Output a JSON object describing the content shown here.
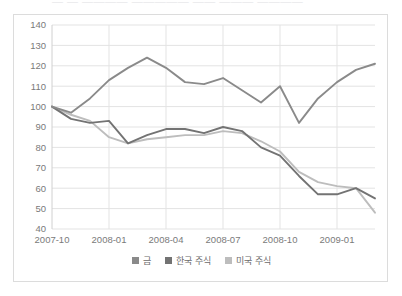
{
  "page": {
    "clipped_header_text": "— — ———— ————— —— ——— ————"
  },
  "legend": {
    "position": "bottom-center",
    "items": [
      {
        "label": "금",
        "color": "#8a8a8a"
      },
      {
        "label": "한국 주식",
        "color": "#737373"
      },
      {
        "label": "미국 주식",
        "color": "#bdbdbd"
      }
    ]
  },
  "chart_data": {
    "type": "line",
    "title": "",
    "subtitle": "",
    "xlabel": "",
    "ylabel": "",
    "ylim": [
      40,
      140
    ],
    "ytick_step": 10,
    "yticks": [
      "140",
      "130",
      "120",
      "110",
      "100",
      "90",
      "80",
      "70",
      "60",
      "50",
      "40"
    ],
    "grid": true,
    "grid_color": "#e3e3e3",
    "x": [
      "2007-10",
      "2007-11",
      "2007-12",
      "2008-01",
      "2008-02",
      "2008-03",
      "2008-04",
      "2008-05",
      "2008-06",
      "2008-07",
      "2008-08",
      "2008-09",
      "2008-10",
      "2008-11",
      "2008-12",
      "2009-01",
      "2009-02",
      "2009-03"
    ],
    "xtick_labels": [
      "2007-10",
      "2008-01",
      "2008-04",
      "2008-07",
      "2008-10",
      "2009-01"
    ],
    "series": [
      {
        "name": "금",
        "color": "#8a8a8a",
        "values": [
          100,
          97,
          104,
          113,
          119,
          124,
          119,
          112,
          111,
          114,
          108,
          102,
          110,
          92,
          104,
          112,
          118,
          121
        ]
      },
      {
        "name": "한국 주식",
        "color": "#737373",
        "values": [
          100,
          94,
          92,
          93,
          82,
          86,
          89,
          89,
          87,
          90,
          88,
          80,
          76,
          66,
          57,
          57,
          60,
          55
        ]
      },
      {
        "name": "미국 주식",
        "color": "#bdbdbd",
        "values": [
          100,
          96,
          93,
          85,
          82,
          84,
          85,
          86,
          86,
          88,
          87,
          83,
          78,
          68,
          63,
          61,
          60,
          48
        ]
      }
    ]
  }
}
